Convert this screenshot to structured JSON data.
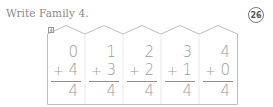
{
  "instruction": "Write Family 4.",
  "page_number": "26",
  "family": {
    "tag": "4",
    "problems": [
      {
        "top": "0",
        "operator": "+",
        "addend": "4",
        "sum": "4"
      },
      {
        "top": "1",
        "operator": "+",
        "addend": "3",
        "sum": "4"
      },
      {
        "top": "2",
        "operator": "+",
        "addend": "2",
        "sum": "4"
      },
      {
        "top": "3",
        "operator": "+",
        "addend": "1",
        "sum": "4"
      },
      {
        "top": "4",
        "operator": "+",
        "addend": "0",
        "sum": "4"
      }
    ]
  },
  "colors": {
    "text": "#9c9c9c",
    "outline": "#b5b5b5",
    "instruction": "#8a8a8a"
  }
}
